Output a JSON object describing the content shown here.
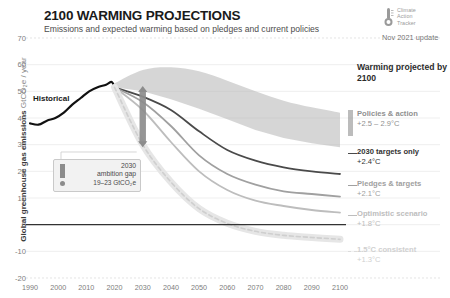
{
  "header": {
    "title": "2100 WARMING PROJECTIONS",
    "subtitle": "Emissions and expected warming based on pledges and current policies",
    "logo_line1": "Climate",
    "logo_line2": "Action",
    "logo_line3": "Tracker",
    "update": "Nov 2021 update"
  },
  "legend": {
    "heading": "Warming projected by 2100",
    "items": [
      {
        "name": "Policies & action",
        "value": "+2.5 – 2.9°C",
        "color": "#8f8f8f",
        "style": "band"
      },
      {
        "name": "2030 targets only",
        "value": "+2.4°C",
        "color": "#4a4a4a",
        "style": "solid"
      },
      {
        "name": "Pledges & targets",
        "value": "+2.1°C",
        "color": "#a0a0a0",
        "style": "solid"
      },
      {
        "name": "Optimistic scenario",
        "value": "+1.8°C",
        "color": "#bdbdbd",
        "style": "solid"
      },
      {
        "name": "1.5°C consistent",
        "value": "+1.3°C",
        "color": "#dcdcdc",
        "style": "dashed"
      }
    ]
  },
  "annotations": {
    "historical": "Historical",
    "gap_year": "2030",
    "gap_title": "ambition gap",
    "gap_value": "19–23 GtCO₂e"
  },
  "chart_data": {
    "type": "line",
    "title": "2100 WARMING PROJECTIONS",
    "subtitle": "Emissions and expected warming based on pledges and current policies",
    "xlabel": "",
    "ylabel": "Global greenhouse gas emissions GtCO₂e / year",
    "ylabel_main": "Global greenhouse gas emissions",
    "ylabel_unit": "GtCO₂e / year",
    "xlim": [
      1990,
      2100
    ],
    "ylim": [
      -20,
      70
    ],
    "xticks": [
      1990,
      2000,
      2010,
      2020,
      2030,
      2040,
      2050,
      2060,
      2070,
      2080,
      2090,
      2100
    ],
    "yticks": [
      70,
      60,
      50,
      40,
      30,
      20,
      10,
      0,
      -10,
      -20
    ],
    "grid": true,
    "legend_position": "right",
    "zero_line": 0,
    "series": [
      {
        "name": "Historical",
        "color": "#111111",
        "style": "solid",
        "x": [
          1990,
          1993,
          1996,
          1999,
          2002,
          2005,
          2008,
          2011,
          2014,
          2017,
          2019,
          2020
        ],
        "values": [
          38,
          37.5,
          39,
          40,
          42,
          45,
          47.5,
          50,
          51.5,
          52.5,
          53.5,
          51.5
        ]
      },
      {
        "name": "Policies & action upper",
        "color": "#b4b4b4",
        "style": "band-upper",
        "x": [
          2020,
          2030,
          2040,
          2050,
          2060,
          2070,
          2080,
          2090,
          2100
        ],
        "values": [
          53,
          58,
          59,
          57.5,
          54,
          50,
          46.5,
          44,
          42
        ]
      },
      {
        "name": "Policies & action lower",
        "color": "#b4b4b4",
        "style": "band-lower",
        "x": [
          2020,
          2030,
          2040,
          2050,
          2060,
          2070,
          2080,
          2090,
          2100
        ],
        "values": [
          51.5,
          50,
          47,
          43.5,
          39.5,
          35.5,
          32.5,
          30.5,
          29
        ]
      },
      {
        "name": "2030 targets only",
        "color": "#4a4a4a",
        "style": "solid",
        "x": [
          2020,
          2030,
          2040,
          2050,
          2060,
          2070,
          2080,
          2090,
          2100
        ],
        "values": [
          51.5,
          48,
          43,
          35,
          28,
          24,
          21.5,
          20,
          19
        ]
      },
      {
        "name": "Pledges & targets",
        "color": "#a0a0a0",
        "style": "solid",
        "x": [
          2020,
          2030,
          2040,
          2050,
          2060,
          2070,
          2080,
          2090,
          2100
        ],
        "values": [
          51.5,
          46,
          37,
          26,
          19,
          15,
          12.5,
          11.5,
          10.5
        ]
      },
      {
        "name": "Optimistic scenario",
        "color": "#bdbdbd",
        "style": "solid",
        "x": [
          2020,
          2030,
          2040,
          2050,
          2060,
          2070,
          2080,
          2090,
          2100
        ],
        "values": [
          51.5,
          43,
          31,
          20,
          13,
          9,
          7,
          5.5,
          4.5
        ]
      },
      {
        "name": "1.5°C consistent",
        "color": "#cfcfcf",
        "style": "dashed",
        "x": [
          2020,
          2030,
          2040,
          2050,
          2060,
          2070,
          2080,
          2090,
          2100
        ],
        "values": [
          51.5,
          30,
          16,
          6,
          0.5,
          -2.5,
          -4,
          -4.8,
          -5.5
        ]
      }
    ],
    "ambition_gap": {
      "year": 2030,
      "top": 52,
      "bottom": 29,
      "label": "2030 ambition gap",
      "value": "19–23 GtCO₂e"
    }
  }
}
